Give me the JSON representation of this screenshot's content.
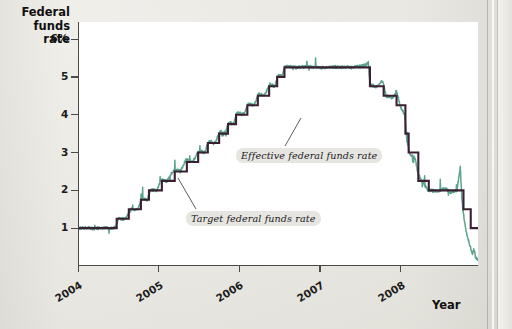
{
  "axes": {
    "y_title": "Federal funds rate",
    "x_title": "Year",
    "y_ticks": [
      {
        "value": 6,
        "label": "6%"
      },
      {
        "value": 5,
        "label": "5"
      },
      {
        "value": 4,
        "label": "4"
      },
      {
        "value": 3,
        "label": "3"
      },
      {
        "value": 2,
        "label": "2"
      },
      {
        "value": 1,
        "label": "1"
      }
    ],
    "x_ticks": [
      {
        "value": 2004,
        "label": "2004"
      },
      {
        "value": 2005,
        "label": "2005"
      },
      {
        "value": 2006,
        "label": "2006"
      },
      {
        "value": 2007,
        "label": "2007"
      },
      {
        "value": 2008,
        "label": "2008"
      }
    ]
  },
  "annotations": {
    "target": "Target federal funds rate",
    "effective": "Effective federal funds rate"
  },
  "colors": {
    "target_line": "#3b1f33",
    "effective_line": "#5aa48d",
    "axis": "#4c4a47",
    "panel": "#ffffff",
    "page": "#e9e8e3",
    "text": "#1d1c1b"
  },
  "chart_data": {
    "type": "line",
    "title": "",
    "subtitle": "",
    "xlabel": "Year",
    "ylabel": "Federal funds rate",
    "xlim": [
      2004.0,
      2008.96
    ],
    "ylim": [
      0.0,
      6.45
    ],
    "grid": false,
    "legend": "annotations-on-plot",
    "ytick_values": [
      1,
      2,
      3,
      4,
      5,
      6
    ],
    "ytick_labels": [
      "1",
      "2",
      "3",
      "4",
      "5",
      "6%"
    ],
    "xtick_values": [
      2004,
      2005,
      2006,
      2007,
      2008
    ],
    "xtick_labels": [
      "2004",
      "2005",
      "2006",
      "2007",
      "2008"
    ],
    "series": [
      {
        "name": "Target federal funds rate",
        "color": "#3b1f33",
        "style": "step",
        "points": [
          [
            2004.0,
            1.0
          ],
          [
            2004.48,
            1.0
          ],
          [
            2004.48,
            1.25
          ],
          [
            2004.63,
            1.25
          ],
          [
            2004.63,
            1.5
          ],
          [
            2004.78,
            1.5
          ],
          [
            2004.78,
            1.75
          ],
          [
            2004.88,
            1.75
          ],
          [
            2004.88,
            2.0
          ],
          [
            2005.04,
            2.0
          ],
          [
            2005.04,
            2.25
          ],
          [
            2005.2,
            2.25
          ],
          [
            2005.2,
            2.5
          ],
          [
            2005.35,
            2.5
          ],
          [
            2005.35,
            2.75
          ],
          [
            2005.49,
            2.75
          ],
          [
            2005.49,
            3.0
          ],
          [
            2005.61,
            3.0
          ],
          [
            2005.61,
            3.25
          ],
          [
            2005.75,
            3.25
          ],
          [
            2005.75,
            3.5
          ],
          [
            2005.86,
            3.5
          ],
          [
            2005.86,
            3.75
          ],
          [
            2005.96,
            3.75
          ],
          [
            2005.96,
            4.0
          ],
          [
            2006.1,
            4.0
          ],
          [
            2006.1,
            4.25
          ],
          [
            2006.23,
            4.25
          ],
          [
            2006.23,
            4.5
          ],
          [
            2006.37,
            4.5
          ],
          [
            2006.37,
            4.75
          ],
          [
            2006.47,
            4.75
          ],
          [
            2006.47,
            5.0
          ],
          [
            2006.56,
            5.0
          ],
          [
            2006.56,
            5.25
          ],
          [
            2007.62,
            5.25
          ],
          [
            2007.62,
            4.75
          ],
          [
            2007.79,
            4.75
          ],
          [
            2007.79,
            4.5
          ],
          [
            2007.95,
            4.5
          ],
          [
            2007.95,
            4.25
          ],
          [
            2008.06,
            4.25
          ],
          [
            2008.06,
            3.5
          ],
          [
            2008.1,
            3.5
          ],
          [
            2008.1,
            3.0
          ],
          [
            2008.22,
            3.0
          ],
          [
            2008.22,
            2.25
          ],
          [
            2008.35,
            2.25
          ],
          [
            2008.35,
            2.0
          ],
          [
            2008.78,
            2.0
          ],
          [
            2008.78,
            1.5
          ],
          [
            2008.87,
            1.5
          ],
          [
            2008.87,
            1.0
          ],
          [
            2008.96,
            1.0
          ]
        ]
      },
      {
        "name": "Effective federal funds rate",
        "color": "#5aa48d",
        "style": "noisy-daily",
        "description": "Daily effective rate tracking the target with small spikes; in late 2008 it falls well below target toward ~0.15",
        "points": [
          [
            2004.0,
            1.0
          ],
          [
            2004.1,
            1.01
          ],
          [
            2004.2,
            0.99
          ],
          [
            2004.3,
            1.01
          ],
          [
            2004.4,
            1.0
          ],
          [
            2004.47,
            1.03
          ],
          [
            2004.5,
            1.26
          ],
          [
            2004.58,
            1.24
          ],
          [
            2004.62,
            1.35
          ],
          [
            2004.66,
            1.5
          ],
          [
            2004.74,
            1.49
          ],
          [
            2004.79,
            1.78
          ],
          [
            2004.86,
            1.75
          ],
          [
            2004.9,
            2.02
          ],
          [
            2004.98,
            1.99
          ],
          [
            2005.03,
            2.28
          ],
          [
            2005.1,
            2.24
          ],
          [
            2005.19,
            2.55
          ],
          [
            2005.27,
            2.5
          ],
          [
            2005.34,
            2.82
          ],
          [
            2005.42,
            2.74
          ],
          [
            2005.5,
            3.05
          ],
          [
            2005.57,
            3.0
          ],
          [
            2005.62,
            3.3
          ],
          [
            2005.7,
            3.25
          ],
          [
            2005.76,
            3.56
          ],
          [
            2005.82,
            3.5
          ],
          [
            2005.87,
            3.8
          ],
          [
            2005.93,
            3.76
          ],
          [
            2005.97,
            4.06
          ],
          [
            2006.05,
            4.0
          ],
          [
            2006.11,
            4.3
          ],
          [
            2006.18,
            4.25
          ],
          [
            2006.24,
            4.55
          ],
          [
            2006.31,
            4.5
          ],
          [
            2006.38,
            4.8
          ],
          [
            2006.44,
            4.75
          ],
          [
            2006.48,
            5.04
          ],
          [
            2006.53,
            5.0
          ],
          [
            2006.57,
            5.3
          ],
          [
            2006.7,
            5.25
          ],
          [
            2006.85,
            5.27
          ],
          [
            2007.0,
            5.24
          ],
          [
            2007.2,
            5.26
          ],
          [
            2007.4,
            5.25
          ],
          [
            2007.55,
            5.3
          ],
          [
            2007.6,
            5.38
          ],
          [
            2007.62,
            4.8
          ],
          [
            2007.7,
            4.74
          ],
          [
            2007.78,
            4.9
          ],
          [
            2007.82,
            4.49
          ],
          [
            2007.9,
            4.45
          ],
          [
            2007.95,
            4.6
          ],
          [
            2008.0,
            4.22
          ],
          [
            2008.05,
            4.0
          ],
          [
            2008.08,
            3.3
          ],
          [
            2008.12,
            2.95
          ],
          [
            2008.18,
            2.85
          ],
          [
            2008.22,
            2.4
          ],
          [
            2008.28,
            2.2
          ],
          [
            2008.34,
            2.0
          ],
          [
            2008.45,
            1.98
          ],
          [
            2008.55,
            2.05
          ],
          [
            2008.62,
            1.95
          ],
          [
            2008.7,
            2.0
          ],
          [
            2008.74,
            2.6
          ],
          [
            2008.76,
            1.8
          ],
          [
            2008.79,
            1.2
          ],
          [
            2008.82,
            0.85
          ],
          [
            2008.86,
            0.55
          ],
          [
            2008.89,
            0.3
          ],
          [
            2008.91,
            0.45
          ],
          [
            2008.93,
            0.22
          ],
          [
            2008.96,
            0.15
          ]
        ]
      }
    ]
  }
}
